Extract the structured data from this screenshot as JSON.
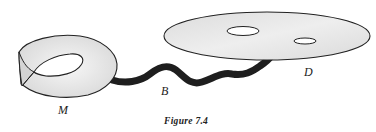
{
  "figure": {
    "caption": "Figure 7.4",
    "labels": {
      "mobius": "M",
      "band": "B",
      "disk": "D"
    },
    "colors": {
      "surface_fill": "#e6e6e6",
      "surface_highlight": "#f8f8f8",
      "outline": "#222222",
      "band": "#1e1e1e",
      "hole": "#ffffff"
    }
  }
}
